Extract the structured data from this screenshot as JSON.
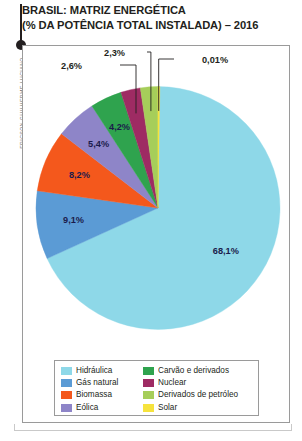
{
  "title": {
    "line1": "BRASIL: MATRIZ ENERGÉTICA",
    "line2": "(% DA POTÊNCIA TOTAL INSTALADA) – 2016"
  },
  "credit": "ERICSON GUILHERME LUCIANO",
  "legend": {
    "items": [
      {
        "label": "Hidráulica",
        "color": "#8ED8E8"
      },
      {
        "label": "Carvão e derivados",
        "color": "#2FA34E"
      },
      {
        "label": "Gás natural",
        "color": "#5B9BD5"
      },
      {
        "label": "Nuclear",
        "color": "#9E2B63"
      },
      {
        "label": "Biomassa",
        "color": "#F4581C"
      },
      {
        "label": "Derivados de petróleo",
        "color": "#A6CE5A"
      },
      {
        "label": "Eólica",
        "color": "#8E85C8"
      },
      {
        "label": "Solar",
        "color": "#F6E33D"
      }
    ]
  },
  "chart_data": {
    "type": "pie",
    "title": "BRASIL: MATRIZ ENERGÉTICA (% DA POTÊNCIA TOTAL INSTALADA) – 2016",
    "unit": "%",
    "legend_position": "bottom",
    "categories": [
      "Hidráulica",
      "Gás natural",
      "Biomassa",
      "Eólica",
      "Carvão e derivados",
      "Nuclear",
      "Derivados de petróleo",
      "Solar"
    ],
    "values": [
      68.1,
      9.1,
      8.2,
      5.4,
      4.2,
      2.6,
      2.3,
      0.01
    ],
    "value_labels": [
      "68,1%",
      "9,1%",
      "8,2%",
      "5,4%",
      "4,2%",
      "2,6%",
      "2,3%",
      "0,01%"
    ],
    "colors": [
      "#8ED8E8",
      "#5B9BD5",
      "#F4581C",
      "#8E85C8",
      "#2FA34E",
      "#9E2B63",
      "#A6CE5A",
      "#F6E33D"
    ],
    "label_placement": [
      "inside",
      "inside",
      "inside",
      "inside",
      "inside",
      "callout",
      "callout",
      "callout"
    ]
  }
}
